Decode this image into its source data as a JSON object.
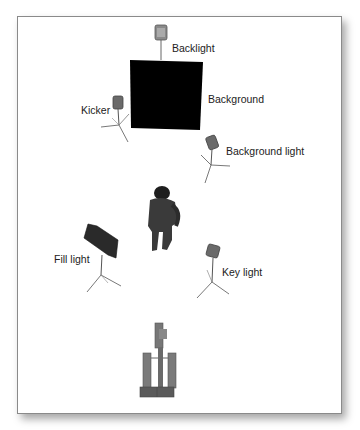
{
  "diagram": {
    "labels": {
      "backlight": "Backlight",
      "background": "Background",
      "kicker": "Kicker",
      "background_light": "Background light",
      "fill_light": "Fill light",
      "key_light": "Key light"
    },
    "colors": {
      "background_panel": "#000000",
      "light_body": "#6e6e6e",
      "stand": "#555555",
      "figure": "#3a3a3a",
      "frame_border": "#8a8a8a"
    }
  }
}
